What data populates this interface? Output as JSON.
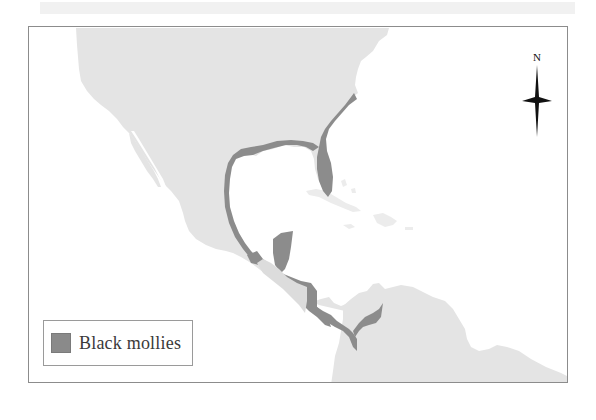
{
  "map": {
    "title": "",
    "colors": {
      "land": "#e3e3e3",
      "range": "#8c8c8c",
      "highland": "#dedede",
      "water": "#ffffff",
      "frame": "#8c8c8c"
    },
    "compass": {
      "label": "N",
      "icon": "north-arrow-compass-star"
    },
    "legend": {
      "items": [
        {
          "label": "Black mollies",
          "color": "#8a8a8a"
        }
      ]
    },
    "regions_shown": [
      "North America",
      "Mexico",
      "Gulf of Mexico",
      "Central America",
      "Caribbean",
      "South America"
    ]
  }
}
